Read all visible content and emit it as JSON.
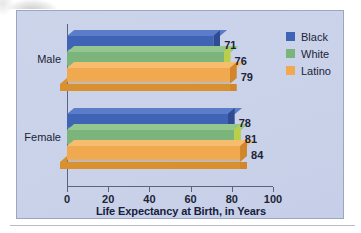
{
  "chart_data": {
    "type": "bar",
    "orientation": "horizontal",
    "style": "3d-grouped",
    "title": "",
    "xlabel": "Life Expectancy at Birth, in Years",
    "ylabel": "",
    "xlim": [
      0,
      100
    ],
    "xticks": [
      0,
      20,
      40,
      60,
      80,
      100
    ],
    "xtick_labels": [
      "0",
      "20",
      "40",
      "60",
      "80",
      "100"
    ],
    "grid": false,
    "legend_position": "top-right",
    "categories": [
      "Male",
      "Female"
    ],
    "series": [
      {
        "name": "Black",
        "color": "#3f63b5",
        "values": [
          71,
          78
        ]
      },
      {
        "name": "White",
        "color": "#7cb57c",
        "values": [
          76,
          81
        ]
      },
      {
        "name": "Latino",
        "color": "#f0a94e",
        "values": [
          79,
          84
        ]
      }
    ],
    "data_labels": {
      "Male": [
        "71",
        "76",
        "79"
      ],
      "Female": [
        "78",
        "81",
        "84"
      ]
    }
  },
  "legend": {
    "items": [
      {
        "label": "Black",
        "color": "#3f63b5"
      },
      {
        "label": "White",
        "color": "#7cb57c"
      },
      {
        "label": "Latino",
        "color": "#f0a94e"
      }
    ]
  },
  "axis": {
    "x_title": "Life Expectancy at Birth, in Years",
    "ticks": [
      "0",
      "20",
      "40",
      "60",
      "80",
      "100"
    ]
  },
  "groups": [
    {
      "label": "Male"
    },
    {
      "label": "Female"
    }
  ],
  "colors": {
    "panel_bg": "#ccd4ea",
    "panel_border": "#9aa6c4",
    "axis": "#5a6480",
    "text": "#1c2436",
    "blue": "#3f63b5",
    "blue_top": "#5b7cc8",
    "blue_cap": "#2f4c92",
    "green": "#7cb57c",
    "green_top": "#93c78f",
    "green_cap": "#b9cf4a",
    "orange": "#f0a94e",
    "orange_top": "#f6bd6e",
    "orange_cap": "#d2862c",
    "orange_floor": "#d9912f"
  }
}
